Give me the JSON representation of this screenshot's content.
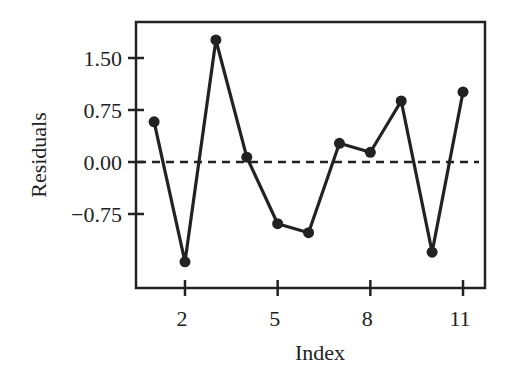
{
  "chart_data": {
    "type": "line",
    "title": "",
    "xlabel": "Index",
    "ylabel": "Residuals",
    "x": [
      1,
      2,
      3,
      4,
      5,
      6,
      7,
      8,
      9,
      10,
      11
    ],
    "series": [
      {
        "name": "Residuals",
        "values": [
          0.58,
          -1.44,
          1.76,
          0.07,
          -0.89,
          -1.02,
          0.27,
          0.14,
          0.88,
          -1.3,
          1.01
        ],
        "marker": "circle",
        "color": "#222222"
      }
    ],
    "reference_line": {
      "y": 0.0,
      "style": "dashed",
      "color": "#222222"
    },
    "x_ticks": [
      2,
      5,
      8,
      11
    ],
    "x_tick_labels": [
      "2",
      "5",
      "8",
      "11"
    ],
    "y_ticks": [
      -0.75,
      0.0,
      0.75,
      1.5
    ],
    "y_tick_labels": [
      "−0.75",
      "0.00",
      "0.75",
      "1.50"
    ],
    "xlim": [
      0.5,
      11.75
    ],
    "ylim": [
      -1.82,
      2.02
    ],
    "grid": false,
    "legend": null
  },
  "layout": {
    "plot": {
      "left": 136,
      "top": 22,
      "right": 485,
      "bottom": 288
    },
    "x_px": {
      "v0": 2,
      "p0": 185,
      "v1": 11,
      "p1": 463
    },
    "y_px": {
      "v0": 0.0,
      "p0": 162,
      "v1": 1.5,
      "p1": 58
    }
  }
}
